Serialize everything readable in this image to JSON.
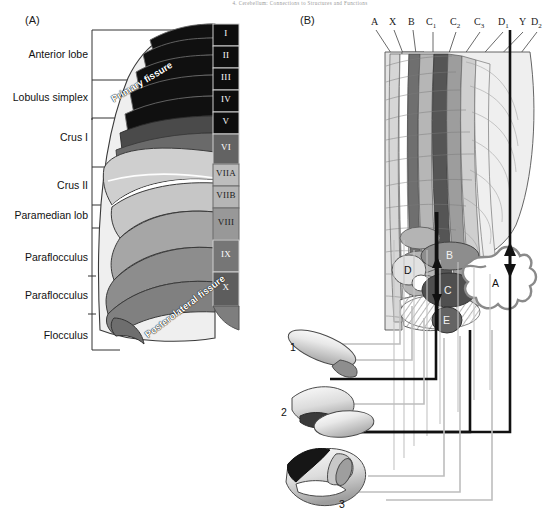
{
  "figure": {
    "running_header": "4. Cerebellum: Connections to Structures and Functions",
    "panels": [
      {
        "id": "A",
        "label": "(A)"
      },
      {
        "id": "B",
        "label": "(B)"
      }
    ]
  },
  "panel_a": {
    "side_labels": [
      {
        "text": "Anterior lobe",
        "y": 55
      },
      {
        "text": "Lobulus simplex",
        "y": 98
      },
      {
        "text": "Crus I",
        "y": 138
      },
      {
        "text": "Crus II",
        "y": 186
      },
      {
        "text": "Paramedian lob",
        "y": 216
      },
      {
        "text": "Paraflocculus",
        "y": 258
      },
      {
        "text": "Paraflocculus",
        "y": 296
      },
      {
        "text": "Flocculus",
        "y": 336
      }
    ],
    "lobules": [
      {
        "numeral": "I",
        "y": 33,
        "h": 22,
        "fill": "#0d0d0d"
      },
      {
        "numeral": "II",
        "y": 55,
        "h": 22,
        "fill": "#0d0d0d"
      },
      {
        "numeral": "III",
        "y": 77,
        "h": 22,
        "fill": "#0d0d0d"
      },
      {
        "numeral": "IV",
        "y": 99,
        "h": 22,
        "fill": "#0d0d0d"
      },
      {
        "numeral": "V",
        "y": 121,
        "h": 22,
        "fill": "#0d0d0d"
      },
      {
        "numeral": "VI",
        "y": 143,
        "h": 28,
        "fill": "#595959"
      },
      {
        "numeral": "VIIA",
        "y": 171,
        "h": 22,
        "fill": "#b8b8b8"
      },
      {
        "numeral": "VIIB",
        "y": 193,
        "h": 22,
        "fill": "#b0b0b0"
      },
      {
        "numeral": "VIII",
        "y": 215,
        "h": 32,
        "fill": "#8f8f8f"
      },
      {
        "numeral": "IX",
        "y": 247,
        "h": 31,
        "fill": "#6e6e6e"
      },
      {
        "numeral": "X",
        "y": 278,
        "h": 31,
        "fill": "#595959"
      }
    ],
    "fissures": [
      {
        "text": "Primary fissure",
        "x": 112,
        "y": 100,
        "rotate": -31
      },
      {
        "text": "Posterolateral fissure",
        "x": 148,
        "y": 330,
        "rotate": -37
      }
    ]
  },
  "panel_b": {
    "zone_labels": [
      {
        "text": "A",
        "sub": "",
        "x": 374,
        "y": 24
      },
      {
        "text": "X",
        "sub": "",
        "x": 392,
        "y": 24
      },
      {
        "text": "B",
        "sub": "",
        "x": 411,
        "y": 24
      },
      {
        "text": "C",
        "sub": "1",
        "x": 430,
        "y": 24
      },
      {
        "text": "C",
        "sub": "2",
        "x": 455,
        "y": 24
      },
      {
        "text": "C",
        "sub": "3",
        "x": 479,
        "y": 24
      },
      {
        "text": "D",
        "sub": "1",
        "x": 503,
        "y": 24
      },
      {
        "text": "Y",
        "sub": "",
        "x": 524,
        "y": 24
      },
      {
        "text": "D",
        "sub": "2",
        "x": 535,
        "y": 24
      }
    ],
    "nuclei": [
      {
        "label": "D",
        "x": 404,
        "y": 272,
        "light": false
      },
      {
        "label": "B",
        "x": 450,
        "y": 254,
        "light": true
      },
      {
        "label": "C",
        "x": 447,
        "y": 291,
        "light": true
      },
      {
        "label": "E",
        "x": 443,
        "y": 321,
        "light": true
      },
      {
        "label": "A",
        "x": 496,
        "y": 283,
        "light": false
      }
    ],
    "olive_subdivisions": [
      {
        "number": "1",
        "x": 293,
        "y": 348
      },
      {
        "number": "2",
        "x": 284,
        "y": 413
      },
      {
        "number": "3",
        "x": 342,
        "y": 505
      }
    ]
  },
  "colors": {
    "black": "#111111",
    "dark_lobule": "#0d0d0d",
    "mid_gray": "#8f8f8f",
    "light_gray": "#d4d4d4",
    "pale": "#efefef",
    "connector_black": "#111111",
    "connector_gray": "#b9b9b9"
  }
}
